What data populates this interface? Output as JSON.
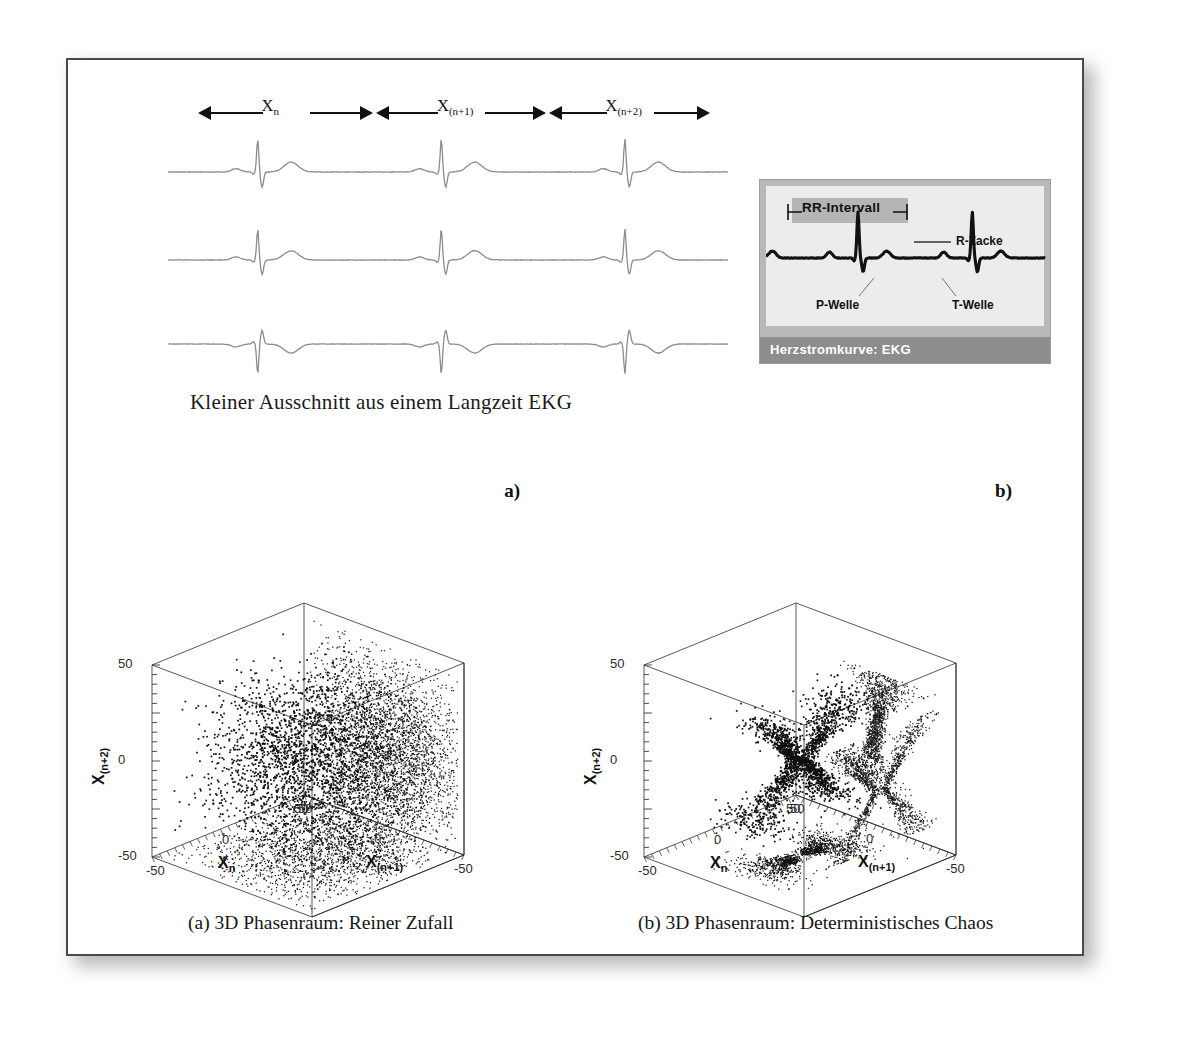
{
  "figure": {
    "ekg": {
      "caption": "Kleiner Ausschnitt aus einem Langzeit EKG",
      "intervals": [
        {
          "label": "X",
          "sub": "n"
        },
        {
          "label": "X",
          "sub": "(n+1)"
        },
        {
          "label": "X",
          "sub": "(n+2)"
        }
      ],
      "trace_count": 3
    },
    "inset": {
      "rr_label": "RR-Intervall",
      "r_label": "R-Zacke",
      "p_label": "P-Welle",
      "t_label": "T-Welle",
      "bar_title": "Herzstromkurve: EKG"
    },
    "panels": [
      {
        "tag": "a)",
        "caption": "(a)  3D Phasenraum: Reiner Zufall",
        "axes": {
          "x": {
            "label": "X",
            "sub": "n",
            "ticks": [
              "50",
              "0",
              "-50"
            ]
          },
          "y": {
            "label": "X",
            "sub": "(n+1)",
            "ticks": [
              "-50",
              "0",
              "50"
            ]
          },
          "z": {
            "label": "X",
            "sub": "(n+2)",
            "ticks": [
              "50",
              "0",
              "-50"
            ]
          }
        }
      },
      {
        "tag": "b)",
        "caption": "(b)  3D Phasenraum: Deterministisches Chaos",
        "axes": {
          "x": {
            "label": "X",
            "sub": "n",
            "ticks": [
              "50",
              "0",
              "-50"
            ]
          },
          "y": {
            "label": "X",
            "sub": "(n+1)",
            "ticks": [
              "-50",
              "0",
              "50"
            ]
          },
          "z": {
            "label": "X",
            "sub": "(n+2)",
            "ticks": [
              "50",
              "0",
              "-50"
            ]
          }
        }
      }
    ]
  },
  "chart_data": [
    {
      "type": "scatter",
      "title": "(a)  3D Phasenraum: Reiner Zufall",
      "dimensions": 3,
      "xlabel": "X_n",
      "ylabel": "X_(n+1)",
      "zlabel": "X_(n+2)",
      "xlim": [
        -50,
        50
      ],
      "ylim": [
        -50,
        50
      ],
      "zlim": [
        -50,
        50
      ],
      "xticks": [
        50,
        0,
        -50
      ],
      "yticks": [
        -50,
        0,
        50
      ],
      "zticks": [
        50,
        0,
        -50
      ],
      "grid": false,
      "legend": null,
      "description": "Isotropic random point cloud filling the centre of the cube; 2D shadow projections rendered on the left wall, right wall and floor.",
      "n_points": 2500,
      "cloud": {
        "shape": "gaussian-blob",
        "center": [
          0,
          0,
          0
        ],
        "spread": [
          26,
          26,
          26
        ]
      },
      "projections": [
        "left-wall",
        "right-wall",
        "floor"
      ]
    },
    {
      "type": "scatter",
      "title": "(b)  3D Phasenraum: Deterministisches Chaos",
      "dimensions": 3,
      "xlabel": "X_n",
      "ylabel": "X_(n+1)",
      "zlabel": "X_(n+2)",
      "xlim": [
        -50,
        50
      ],
      "ylim": [
        -50,
        50
      ],
      "zlim": [
        -50,
        50
      ],
      "xticks": [
        50,
        0,
        -50
      ],
      "yticks": [
        -50,
        0,
        50
      ],
      "zticks": [
        50,
        0,
        -50
      ],
      "grid": false,
      "legend": null,
      "description": "Thin bow-tie / butterfly shaped deterministic attractor; elongated streak on the left wall, bow-tie on the right wall, narrow band on the floor.",
      "n_points": 2200,
      "cloud": {
        "shape": "bowtie-attractor",
        "center": [
          0,
          0,
          0
        ],
        "spread": [
          22,
          22,
          26
        ]
      },
      "projections": [
        "left-wall",
        "right-wall",
        "floor"
      ]
    }
  ]
}
